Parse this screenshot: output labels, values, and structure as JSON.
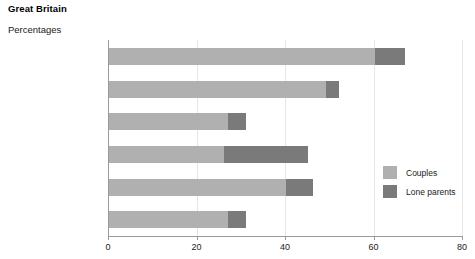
{
  "header": {
    "title": "Great Britain",
    "subtitle": "Percentages"
  },
  "legend": {
    "position": "inside-right",
    "items": [
      {
        "label": "Couples",
        "color": "#b0b0b0",
        "name": "couples"
      },
      {
        "label": "Lone parents",
        "color": "#7a7a7a",
        "name": "lone-parents"
      }
    ]
  },
  "axis": {
    "xlabel": "",
    "ylabel": "",
    "xlim": [
      0,
      80
    ],
    "ticks": [
      0,
      20,
      40,
      60,
      80
    ],
    "ticklabels": [
      "0",
      "20",
      "40",
      "60",
      "80"
    ],
    "grid": true
  },
  "footnote_markers": {
    "black": "2",
    "other": "3",
    "all_ethnic_groups": "4"
  },
  "chart_data": {
    "type": "bar",
    "orientation": "horizontal",
    "stacked": true,
    "title": "Great Britain",
    "subtitle": "Percentages",
    "xlabel": "",
    "ylabel": "",
    "xlim": [
      0,
      80
    ],
    "xticks": [
      0,
      20,
      40,
      60,
      80
    ],
    "grid": true,
    "legend_position": "inside-right",
    "categories": [
      "Bangladeshi/Pakistani",
      "Indian",
      "White",
      "Black",
      "Other",
      "All ethnic groups"
    ],
    "category_footnotes": [
      "",
      "",
      "",
      "2",
      "3",
      "4"
    ],
    "series": [
      {
        "name": "Couples",
        "color": "#b0b0b0",
        "values": [
          60,
          49,
          27,
          26,
          40,
          27
        ]
      },
      {
        "name": "Lone parents",
        "color": "#7a7a7a",
        "values": [
          7,
          3,
          4,
          19,
          6,
          4
        ]
      }
    ],
    "totals": [
      67,
      52,
      31,
      45,
      46,
      31
    ]
  }
}
